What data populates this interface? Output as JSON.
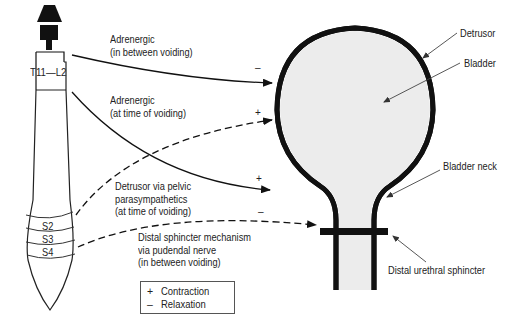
{
  "spinal_cord": {
    "upper_segment_label": "T11—L2",
    "sacral_segments": [
      "S2",
      "S3",
      "S4"
    ]
  },
  "pathways": {
    "adrenergic_between": [
      "Adrenergic",
      "(in between voiding)"
    ],
    "adrenergic_voiding": [
      "Adrenergic",
      "(at time of voiding)"
    ],
    "detrusor_pelvic": [
      "Detrusor via pelvic",
      "parasympathetics",
      "(at time of voiding)"
    ],
    "distal_sphincter": [
      "Distal sphincter mechanism",
      "via pudendal nerve",
      "(in between voiding)"
    ]
  },
  "signs": {
    "adrenergic_between": "–",
    "adrenergic_voiding": "+",
    "detrusor_pelvic": "+",
    "distal_sphincter": "–"
  },
  "anatomy_labels": {
    "detrusor": "Detrusor",
    "bladder": "Bladder",
    "bladder_neck": "Bladder neck",
    "distal_urethral_sphincter": "Distal urethral sphincter"
  },
  "legend": {
    "items": [
      {
        "symbol": "+",
        "label": "Contraction"
      },
      {
        "symbol": "–",
        "label": "Relaxation"
      }
    ]
  },
  "colors": {
    "stroke": "#111111",
    "bladder_fill": "#ececec",
    "text": "#222222"
  }
}
